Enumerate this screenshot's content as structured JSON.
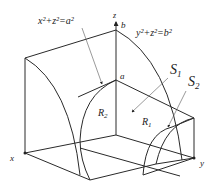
{
  "diagram": {
    "equations": {
      "cylinder_x": "x²+z²=a²",
      "cylinder_y": "y²+z²=b²"
    },
    "axes": {
      "x": "x",
      "y": "y",
      "z": "z"
    },
    "points": {
      "a": "a",
      "b": "b"
    },
    "regions": {
      "R1": "R",
      "R1_sub": "1",
      "R2": "R",
      "R2_sub": "2"
    },
    "surfaces": {
      "S1": "S",
      "S1_sub": "1",
      "S2": "S",
      "S2_sub": "2"
    },
    "colors": {
      "line": "#2a2a2a",
      "background": "#ffffff"
    }
  }
}
